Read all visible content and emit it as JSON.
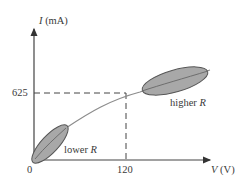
{
  "diagram": {
    "type": "I-V characteristic curve",
    "y_axis": {
      "symbol": "I",
      "unit": "(mA)"
    },
    "x_axis": {
      "symbol": "V",
      "unit": "(V)"
    },
    "ticks": {
      "origin": "0",
      "y_value": "625",
      "x_value": "120"
    },
    "regions": [
      {
        "label_prefix": "lower",
        "label_symbol": "R"
      },
      {
        "label_prefix": "higher",
        "label_symbol": "R"
      }
    ],
    "colors": {
      "axis": "#333333",
      "curve": "#8c8c8c",
      "ellipse_fill": "#a8a8a8",
      "ellipse_stroke": "#555555",
      "dashed": "#444444"
    }
  }
}
